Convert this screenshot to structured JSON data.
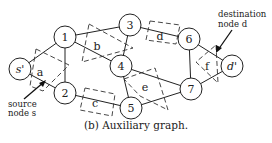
{
  "figure": {
    "caption": "(b) Auxiliary graph.",
    "nodes": [
      {
        "id": "s",
        "label": "s'",
        "x": 20,
        "y": 69,
        "italic": true
      },
      {
        "id": "1",
        "label": "1",
        "x": 65,
        "y": 37
      },
      {
        "id": "2",
        "label": "2",
        "x": 65,
        "y": 93
      },
      {
        "id": "3",
        "label": "3",
        "x": 130,
        "y": 25
      },
      {
        "id": "4",
        "label": "4",
        "x": 121,
        "y": 66
      },
      {
        "id": "5",
        "label": "5",
        "x": 131,
        "y": 108
      },
      {
        "id": "6",
        "label": "6",
        "x": 189,
        "y": 39
      },
      {
        "id": "7",
        "label": "7",
        "x": 191,
        "y": 89
      },
      {
        "id": "d",
        "label": "d'",
        "x": 232,
        "y": 66,
        "italic": true
      }
    ],
    "edges": [
      [
        "s",
        "1"
      ],
      [
        "s",
        "2"
      ],
      [
        "1",
        "2"
      ],
      [
        "1",
        "3"
      ],
      [
        "1",
        "4"
      ],
      [
        "3",
        "4"
      ],
      [
        "4",
        "5"
      ],
      [
        "4",
        "7"
      ],
      [
        "2",
        "5"
      ],
      [
        "3",
        "6"
      ],
      [
        "5",
        "7"
      ],
      [
        "6",
        "7"
      ],
      [
        "6",
        "d"
      ],
      [
        "7",
        "d"
      ]
    ],
    "hyperedges": [
      {
        "label": "a",
        "lx": 40,
        "ly": 72
      },
      {
        "label": "b",
        "lx": 97,
        "ly": 46
      },
      {
        "label": "c",
        "lx": 95,
        "ly": 103
      },
      {
        "label": "d",
        "lx": 160,
        "ly": 36
      },
      {
        "label": "e",
        "lx": 145,
        "ly": 87
      },
      {
        "label": "f",
        "lx": 207,
        "ly": 66
      }
    ],
    "annotations": {
      "source_line1": "source",
      "source_line2": "node s",
      "dest_line1": "destination",
      "dest_line2": "node d"
    }
  }
}
